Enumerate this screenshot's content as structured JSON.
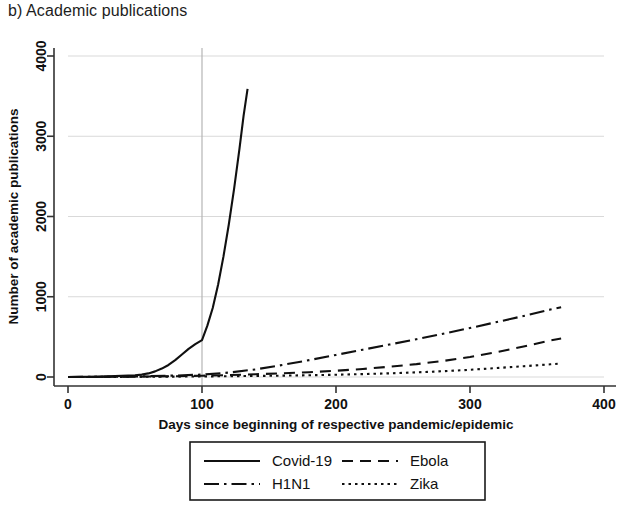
{
  "panel": {
    "title": "b) Academic publications"
  },
  "chart_data": {
    "type": "line",
    "title": "b) Academic publications",
    "xlabel": "Days since beginning of respective pandemic/epidemic",
    "ylabel": "Number of academic publications",
    "xlim": [
      0,
      400
    ],
    "ylim": [
      0,
      4000
    ],
    "xticks": [
      0,
      100,
      200,
      300,
      400
    ],
    "yticks": [
      0,
      1000,
      2000,
      3000,
      4000
    ],
    "xtick_labels": [
      "0",
      "100",
      "200",
      "300",
      "400"
    ],
    "ytick_labels": [
      "0",
      "1000",
      "2000",
      "3000",
      "4000"
    ],
    "grid": "horizontal-and-day100-vertical",
    "legend_position": "bottom-center",
    "annotations": [
      {
        "type": "vertical-reference-line",
        "x": 100
      }
    ],
    "series": [
      {
        "name": "Covid-19",
        "style": "solid",
        "color": "#101010",
        "x": [
          0,
          10,
          20,
          30,
          40,
          50,
          55,
          60,
          65,
          70,
          75,
          80,
          85,
          90,
          95,
          100,
          104,
          108,
          112,
          116,
          120,
          124,
          128,
          131,
          134
        ],
        "y": [
          0,
          2,
          4,
          8,
          14,
          22,
          30,
          45,
          70,
          105,
          150,
          210,
          280,
          350,
          410,
          460,
          640,
          860,
          1150,
          1500,
          1900,
          2350,
          2850,
          3250,
          3590
        ]
      },
      {
        "name": "H1N1",
        "style": "dashdot",
        "color": "#101010",
        "x": [
          0,
          20,
          40,
          60,
          80,
          100,
          120,
          140,
          160,
          180,
          200,
          220,
          240,
          260,
          280,
          300,
          320,
          340,
          360,
          368
        ],
        "y": [
          0,
          2,
          5,
          10,
          18,
          30,
          55,
          95,
          150,
          210,
          275,
          340,
          405,
          470,
          540,
          610,
          685,
          760,
          840,
          870
        ]
      },
      {
        "name": "Ebola",
        "style": "dashed",
        "color": "#101010",
        "x": [
          0,
          20,
          40,
          60,
          80,
          100,
          120,
          140,
          160,
          180,
          200,
          220,
          240,
          260,
          280,
          300,
          320,
          340,
          360,
          368
        ],
        "y": [
          0,
          1,
          3,
          6,
          10,
          16,
          24,
          34,
          46,
          60,
          78,
          100,
          128,
          160,
          200,
          250,
          310,
          380,
          455,
          480
        ]
      },
      {
        "name": "Zika",
        "style": "dotted",
        "color": "#101010",
        "x": [
          0,
          20,
          40,
          60,
          80,
          100,
          120,
          140,
          160,
          180,
          200,
          220,
          240,
          260,
          280,
          300,
          320,
          340,
          360,
          368
        ],
        "y": [
          0,
          1,
          2,
          3,
          5,
          7,
          10,
          13,
          17,
          22,
          28,
          36,
          46,
          58,
          72,
          90,
          112,
          134,
          158,
          168
        ]
      }
    ]
  },
  "legend": {
    "entries": [
      {
        "label": "Covid-19",
        "style": "solid"
      },
      {
        "label": "Ebola",
        "style": "dashed"
      },
      {
        "label": "H1N1",
        "style": "dashdot"
      },
      {
        "label": "Zika",
        "style": "dotted"
      }
    ]
  },
  "colors": {
    "line": "#101010",
    "grid": "#d9d9d9",
    "axis": "#333333",
    "text": "#111111",
    "background": "#ffffff"
  }
}
